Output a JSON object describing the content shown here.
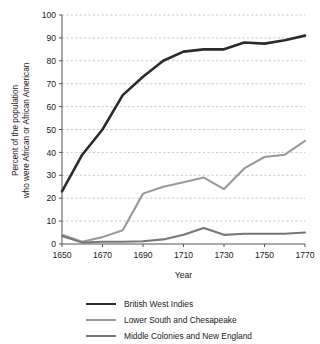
{
  "chart_data": {
    "type": "line",
    "title": "",
    "subtitle": "",
    "xlabel": "Year",
    "ylabel": "Percent of the population who were African or African American",
    "ylabel_line1": "Percent of the population",
    "ylabel_line2": "who were African or African American",
    "x": [
      1650,
      1660,
      1670,
      1680,
      1690,
      1700,
      1710,
      1720,
      1730,
      1740,
      1750,
      1760,
      1770
    ],
    "xlim": [
      1650,
      1770
    ],
    "ylim": [
      0,
      100
    ],
    "xticks": [
      "1650",
      "1670",
      "1690",
      "1710",
      "1730",
      "1750",
      "1770"
    ],
    "xtick_values": [
      1650,
      1670,
      1690,
      1710,
      1730,
      1750,
      1770
    ],
    "yticks": [
      "0",
      "10",
      "20",
      "30",
      "40",
      "50",
      "60",
      "70",
      "80",
      "90",
      "100"
    ],
    "ytick_values": [
      0,
      10,
      20,
      30,
      40,
      50,
      60,
      70,
      80,
      90,
      100
    ],
    "grid": "horizontal-dashed",
    "legend_position": "bottom",
    "series": [
      {
        "name": "British West Indies",
        "color": "#2b2b2b",
        "width": 2.6,
        "values": [
          23,
          39,
          50,
          65,
          73,
          80,
          84,
          85,
          85,
          88,
          87.5,
          89,
          91
        ]
      },
      {
        "name": "Lower South and Chesapeake",
        "color": "#9a9a9a",
        "width": 2.1,
        "values": [
          4,
          1,
          3,
          6,
          22,
          25,
          27,
          29,
          24,
          33,
          38,
          39,
          45
        ]
      },
      {
        "name": "Middle Colonies and New England",
        "color": "#777777",
        "width": 2.1,
        "values": [
          3.5,
          0.6,
          1,
          1,
          1.2,
          2,
          4,
          7,
          4,
          4.5,
          4.5,
          4.5,
          5
        ]
      }
    ]
  },
  "axis": {
    "line_color": "#555555",
    "grid_color": "#bdbdbd"
  }
}
